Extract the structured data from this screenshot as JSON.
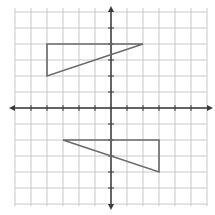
{
  "diagram": {
    "type": "coordinate-plane",
    "grid": {
      "x_min": -6,
      "x_max": 6,
      "y_min": -6,
      "y_max": 6,
      "step": 1
    },
    "colors": {
      "grid": "#c8c8c8",
      "axis": "#3a3a3a",
      "shape": "#6a6a6a",
      "background": "#ffffff"
    },
    "shapes": [
      {
        "name": "triangle-upper",
        "vertices": [
          [
            -4,
            4
          ],
          [
            2,
            4
          ],
          [
            -4,
            2
          ]
        ]
      },
      {
        "name": "triangle-lower",
        "vertices": [
          [
            -3,
            -2
          ],
          [
            3,
            -2
          ],
          [
            3,
            -4
          ]
        ]
      }
    ]
  }
}
